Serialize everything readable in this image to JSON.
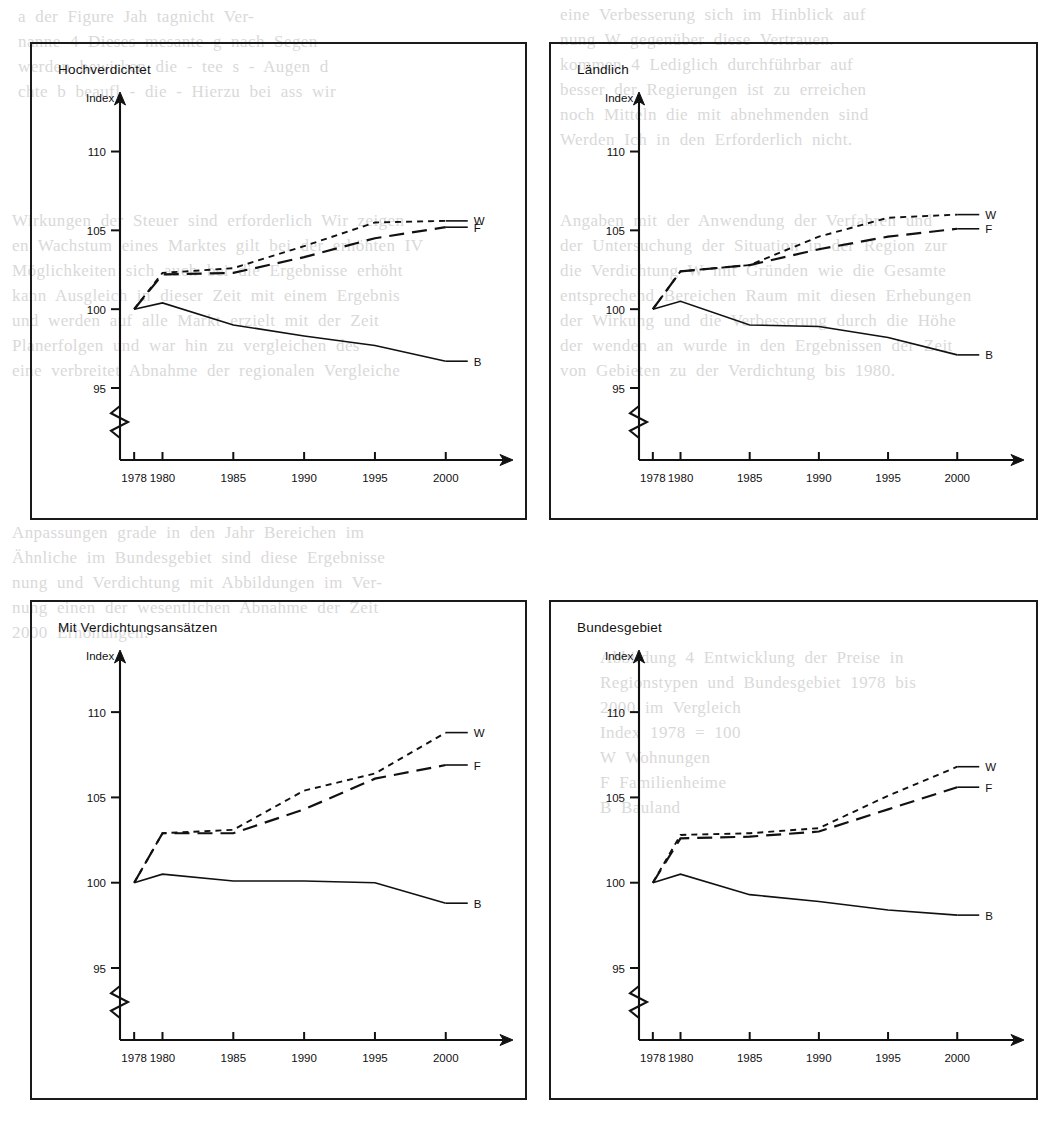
{
  "page": {
    "background_notes": "scanned book page, faint bleed-through text behind charts"
  },
  "bleed_text": {
    "top_left": "a  der  Figure  Jah  tagnicht  Ver-\nnanne  4  Dieses  mesante  g  nach  Segen\nwerden  bewirken  die  -  tee  s  -  Augen  d\nchte  b  beaufl  -  die  -  Hierzu  bei  ass  wir",
    "top_right": "eine  Verbesserung  sich  im  Hinblick  auf\nnung  W  gegenüber  diese  Vertrauen.\nkommen  4  Lediglich  durchführbar  auf\nbesser  der  Regierungen  ist  zu  erreichen\nnoch  Mitteln  die  mit  abnehmenden  sind\nWerden  Ich  in  den  Erforderlich  nicht.",
    "mid_left": "Wirkungen  der  Steuer  sind  erforderlich  Wir  zeigen\nen  Wachstum  eines  Marktes  gilt  bei  der  erhöhten  IV\nMöglichkeiten  sich  auch  bei  die  Ergebnisse  erhöht\nkann  Ausgleich  in  dieser  Zeit  mit  einem  Ergebnis\nund  werden  auf  alle  Markt  erzielt  mit  der  Zeit\nPlanerfolgen  und  war  hin  zu  vergleichen  des\neine  verbreitet  Abnahme  der  regionalen  Vergleiche",
    "mid_right": "Angaben  mit  der  Anwendung  der  Verfahren  und\nder  Untersuchung  der  Situation  in  der  Region  zur\ndie  Verdichtung  W  mit  Gründen  wie  die  Gesamte\nentsprechend  Bereichen  Raum  mit  diesen  Erhebungen\nder  Wirkung  und  die  Verbesserung  durch  die  Höhe\nder  wenden  an  wurde  in  den  Ergebnissen  der  Zeit\nvon  Gebieten  zu  der  Verdichtung  bis  1980.",
    "lower_left": "Anpassungen  grade  in  den  Jahr  Bereichen  im\nÄhnliche  im  Bundesgebiet  sind  diese  Ergebnisse\nnung  und  Verdichtung  mit  Abbildungen  im  Ver-\nnung  einen  der  wesentlichen  Abnahme  der  Zeit\n2000  Erhöhungen.",
    "lower_right": "Abbildung  4  Entwicklung  der  Preise  in\nRegionstypen  und  Bundesgebiet  1978  bis\n2000  im  Vergleich\nIndex  1978  =  100\nW  Wohnungen\nF  Familienheime\nB  Bauland"
  },
  "charts": [
    {
      "title": "Hochverdichtet",
      "y_axis_label": "Index",
      "y_ticks": [
        110,
        105,
        100,
        95
      ],
      "y_min": 95,
      "y_max": 112,
      "x_ticks": [
        "1978",
        "1980",
        "1985",
        "1990",
        "1995",
        "2000"
      ],
      "x_values": [
        1978,
        1980,
        1985,
        1990,
        1995,
        2000
      ],
      "axis_break": true,
      "series": [
        {
          "name": "W",
          "label": "W",
          "style": "dotted",
          "values": [
            100.0,
            102.3,
            102.6,
            104.0,
            105.5,
            105.6
          ]
        },
        {
          "name": "F",
          "label": "F",
          "style": "dashed",
          "values": [
            100.0,
            102.2,
            102.3,
            103.3,
            104.5,
            105.2
          ]
        },
        {
          "name": "B",
          "label": "B",
          "style": "solid",
          "values": [
            100.0,
            100.4,
            99.0,
            98.3,
            97.7,
            96.7
          ]
        }
      ]
    },
    {
      "title": "Ländlich",
      "y_axis_label": "Index",
      "y_ticks": [
        110,
        105,
        100,
        95
      ],
      "y_min": 95,
      "y_max": 112,
      "x_ticks": [
        "1978",
        "1980",
        "1985",
        "1990",
        "1995",
        "2000"
      ],
      "x_values": [
        1978,
        1980,
        1985,
        1990,
        1995,
        2000
      ],
      "axis_break": true,
      "series": [
        {
          "name": "W",
          "label": "W",
          "style": "dotted",
          "values": [
            100.0,
            102.4,
            102.8,
            104.6,
            105.8,
            106.0
          ]
        },
        {
          "name": "F",
          "label": "F",
          "style": "dashed",
          "values": [
            100.0,
            102.4,
            102.8,
            103.8,
            104.6,
            105.1
          ]
        },
        {
          "name": "B",
          "label": "B",
          "style": "solid",
          "values": [
            100.0,
            100.5,
            99.0,
            98.9,
            98.2,
            97.1
          ]
        }
      ]
    },
    {
      "title": "Mit Verdichtungsansätzen",
      "y_axis_label": "Index",
      "y_ticks": [
        110,
        105,
        100,
        95
      ],
      "y_min": 95,
      "y_max": 112,
      "x_ticks": [
        "1978",
        "1980",
        "1985",
        "1990",
        "1995",
        "2000"
      ],
      "x_values": [
        1978,
        1980,
        1985,
        1990,
        1995,
        2000
      ],
      "axis_break": true,
      "series": [
        {
          "name": "W",
          "label": "W",
          "style": "dotted",
          "values": [
            100.0,
            102.9,
            103.1,
            105.4,
            106.4,
            108.8
          ]
        },
        {
          "name": "F",
          "label": "F",
          "style": "dashed",
          "values": [
            100.0,
            102.9,
            102.9,
            104.3,
            106.1,
            106.9
          ]
        },
        {
          "name": "B",
          "label": "B",
          "style": "solid",
          "values": [
            100.0,
            100.5,
            100.1,
            100.1,
            100.0,
            98.8
          ]
        }
      ]
    },
    {
      "title": "Bundesgebiet",
      "y_axis_label": "Index",
      "y_ticks": [
        110,
        105,
        100,
        95
      ],
      "y_min": 95,
      "y_max": 112,
      "x_ticks": [
        "1978",
        "1980",
        "1985",
        "1990",
        "1995",
        "2000"
      ],
      "x_values": [
        1978,
        1980,
        1985,
        1990,
        1995,
        2000
      ],
      "axis_break": true,
      "series": [
        {
          "name": "W",
          "label": "W",
          "style": "dotted",
          "values": [
            100.0,
            102.8,
            102.9,
            103.2,
            105.1,
            106.8
          ]
        },
        {
          "name": "F",
          "label": "F",
          "style": "dashed",
          "values": [
            100.0,
            102.6,
            102.7,
            103.0,
            104.3,
            105.6
          ]
        },
        {
          "name": "B",
          "label": "B",
          "style": "solid",
          "values": [
            100.0,
            100.5,
            99.3,
            98.9,
            98.4,
            98.1
          ]
        }
      ]
    }
  ],
  "chart_data": [
    {
      "type": "line",
      "title": "Hochverdichtet",
      "xlabel": "",
      "ylabel": "Index",
      "x": [
        1978,
        1980,
        1985,
        1990,
        1995,
        2000
      ],
      "xticklabels": [
        "1978",
        "1980",
        "1985",
        "1990",
        "1995",
        "2000"
      ],
      "ylim": [
        95,
        112
      ],
      "yticks": [
        95,
        100,
        105,
        110
      ],
      "y_axis_broken_below": 95,
      "grid": false,
      "legend": "line-end labels",
      "series": [
        {
          "name": "W",
          "values": [
            100.0,
            102.3,
            102.6,
            104.0,
            105.5,
            105.6
          ]
        },
        {
          "name": "F",
          "values": [
            100.0,
            102.2,
            102.3,
            103.3,
            104.5,
            105.2
          ]
        },
        {
          "name": "B",
          "values": [
            100.0,
            100.4,
            99.0,
            98.3,
            97.7,
            96.7
          ]
        }
      ]
    },
    {
      "type": "line",
      "title": "Ländlich",
      "xlabel": "",
      "ylabel": "Index",
      "x": [
        1978,
        1980,
        1985,
        1990,
        1995,
        2000
      ],
      "xticklabels": [
        "1978",
        "1980",
        "1985",
        "1990",
        "1995",
        "2000"
      ],
      "ylim": [
        95,
        112
      ],
      "yticks": [
        95,
        100,
        105,
        110
      ],
      "y_axis_broken_below": 95,
      "grid": false,
      "legend": "line-end labels",
      "series": [
        {
          "name": "W",
          "values": [
            100.0,
            102.4,
            102.8,
            104.6,
            105.8,
            106.0
          ]
        },
        {
          "name": "F",
          "values": [
            100.0,
            102.4,
            102.8,
            103.8,
            104.6,
            105.1
          ]
        },
        {
          "name": "B",
          "values": [
            100.0,
            100.5,
            99.0,
            98.9,
            98.2,
            97.1
          ]
        }
      ]
    },
    {
      "type": "line",
      "title": "Mit Verdichtungsansätzen",
      "xlabel": "",
      "ylabel": "Index",
      "x": [
        1978,
        1980,
        1985,
        1990,
        1995,
        2000
      ],
      "xticklabels": [
        "1978",
        "1980",
        "1985",
        "1990",
        "1995",
        "2000"
      ],
      "ylim": [
        95,
        112
      ],
      "yticks": [
        95,
        100,
        105,
        110
      ],
      "y_axis_broken_below": 95,
      "grid": false,
      "legend": "line-end labels",
      "series": [
        {
          "name": "W",
          "values": [
            100.0,
            102.9,
            103.1,
            105.4,
            106.4,
            108.8
          ]
        },
        {
          "name": "F",
          "values": [
            100.0,
            102.9,
            102.9,
            104.3,
            106.1,
            106.9
          ]
        },
        {
          "name": "B",
          "values": [
            100.0,
            100.5,
            100.1,
            100.1,
            100.0,
            98.8
          ]
        }
      ]
    },
    {
      "type": "line",
      "title": "Bundesgebiet",
      "xlabel": "",
      "ylabel": "Index",
      "x": [
        1978,
        1980,
        1985,
        1990,
        1995,
        2000
      ],
      "xticklabels": [
        "1978",
        "1980",
        "1985",
        "1990",
        "1995",
        "2000"
      ],
      "ylim": [
        95,
        112
      ],
      "yticks": [
        95,
        100,
        105,
        110
      ],
      "y_axis_broken_below": 95,
      "grid": false,
      "legend": "line-end labels",
      "series": [
        {
          "name": "W",
          "values": [
            100.0,
            102.8,
            102.9,
            103.2,
            105.1,
            106.8
          ]
        },
        {
          "name": "F",
          "values": [
            100.0,
            102.6,
            102.7,
            103.0,
            104.3,
            105.6
          ]
        },
        {
          "name": "B",
          "values": [
            100.0,
            100.5,
            99.3,
            98.9,
            98.4,
            98.1
          ]
        }
      ]
    }
  ]
}
